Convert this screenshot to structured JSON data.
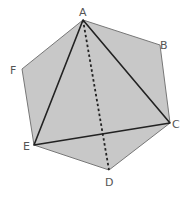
{
  "diagram": {
    "type": "geometry",
    "colors": {
      "fill": "#c8c8c8",
      "hexagon_stroke": "#777777",
      "triangle_stroke": "#222222",
      "dashed_stroke": "#222222",
      "label": "#555555"
    },
    "vertices": {
      "A": {
        "label": "A",
        "x": 83,
        "y": 20
      },
      "B": {
        "label": "B",
        "x": 160,
        "y": 45
      },
      "C": {
        "label": "C",
        "x": 170,
        "y": 123
      },
      "D": {
        "label": "D",
        "x": 109,
        "y": 170
      },
      "E": {
        "label": "E",
        "x": 34,
        "y": 145
      },
      "F": {
        "label": "F",
        "x": 22,
        "y": 69
      }
    },
    "labels": {
      "A": "A",
      "B": "B",
      "C": "C",
      "D": "D",
      "E": "E",
      "F": "F"
    },
    "edges": {
      "hexagon": [
        "A-B",
        "B-C",
        "C-D",
        "D-E",
        "E-F",
        "F-A"
      ],
      "triangle": [
        "A-C",
        "C-E",
        "E-A"
      ],
      "dashed": [
        "A-D"
      ]
    }
  }
}
